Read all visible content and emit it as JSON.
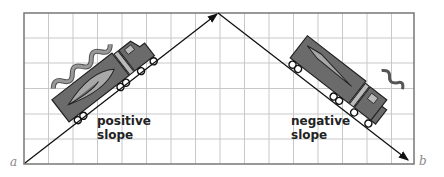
{
  "diagram": {
    "left_label": {
      "line1": "positive",
      "line2": "slope"
    },
    "right_label": {
      "line1": "negative",
      "line2": "slope"
    },
    "point_a": "a",
    "point_b": "b"
  },
  "colors": {
    "grid": "#c8c8c8",
    "frame": "#777777",
    "truck_dark": "#6b6b6b",
    "truck_light": "#a8a8a8",
    "line": "#111111"
  }
}
